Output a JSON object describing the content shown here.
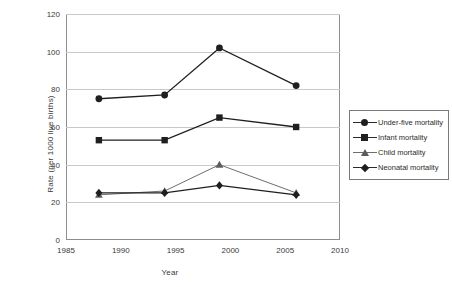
{
  "chart_data": {
    "type": "line",
    "title": "",
    "xlabel": "Year",
    "ylabel": "Rate (per 1000 live births)",
    "x": [
      1988,
      1994,
      1999,
      2006
    ],
    "xlim": [
      1985,
      2010
    ],
    "ylim": [
      0,
      120
    ],
    "xticks": [
      1985,
      1990,
      1995,
      2000,
      2005,
      2010
    ],
    "yticks": [
      0,
      20,
      40,
      60,
      80,
      100,
      120
    ],
    "grid": "horizontal",
    "legend_position": "right",
    "series": [
      {
        "name": "Under-five mortality",
        "marker": "circle",
        "color": "#1f1f1f",
        "values": [
          75,
          77,
          102,
          82
        ]
      },
      {
        "name": "Infant mortality",
        "marker": "square",
        "color": "#1f1f1f",
        "values": [
          53,
          53,
          65,
          60
        ]
      },
      {
        "name": "Child mortality",
        "marker": "triangle",
        "color": "#5c5c5c",
        "values": [
          24,
          26,
          40,
          25
        ]
      },
      {
        "name": "Neonatal mortality",
        "marker": "diamond",
        "color": "#1f1f1f",
        "values": [
          25,
          25,
          29,
          24
        ]
      }
    ]
  },
  "axes": {
    "y_title": "Rate (per 1000 live births)",
    "x_title": "Year",
    "y_ticks": [
      "0",
      "20",
      "40",
      "60",
      "80",
      "100",
      "120"
    ],
    "x_ticks": [
      "1985",
      "1990",
      "1995",
      "2000",
      "2005",
      "2010"
    ]
  },
  "legend": {
    "items": [
      {
        "label": "Under-five mortality",
        "marker": "circle-marker"
      },
      {
        "label": "Infant mortality",
        "marker": "square-marker"
      },
      {
        "label": "Child mortality",
        "marker": "triangle-marker"
      },
      {
        "label": "Neonatal mortality",
        "marker": "diamond-marker"
      }
    ]
  }
}
